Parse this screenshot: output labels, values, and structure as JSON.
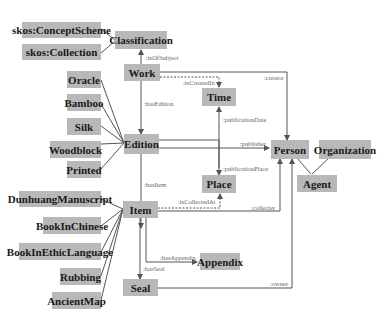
{
  "diagram": {
    "nodes": {
      "concept_scheme": "skos:ConceptScheme",
      "collection": "skos:Collection",
      "classification": "Classification",
      "work": "Work",
      "time": "Time",
      "oracle": "Oracle",
      "bamboo": "Bamboo",
      "silk": "Silk",
      "woodblock": "Woodblock",
      "printed": "Printed",
      "edition": "Edition",
      "person": "Person",
      "organization": "Organization",
      "agent": "Agent",
      "place": "Place",
      "dunhuang": "DunhuangManuscript",
      "item": "Item",
      "book_chinese": "BookInChinese",
      "book_ethic": "BookInEthicLanguage",
      "rubbing": "Rubbing",
      "ancient_map": "AncientMap",
      "appendix": "Appendix",
      "seal": "Seal"
    },
    "edges": {
      "is_of_subject": ":isOfSubject",
      "is_created_in": ":isCreatedIn",
      "creator": ":creator",
      "has_edition": ":hasEdition",
      "publication_date": ":publicationDate",
      "publisher": ":publisher",
      "publication_place": ":publicationPlace",
      "has_item": ":hasItem",
      "is_collected_at": ":isCollectedAt",
      "collecter": ":collecter",
      "has_appendix": ":hasAppendix",
      "has_seal": ":hasSeal",
      "owner": ":owner"
    },
    "colors": {
      "node_fill": "#b8b8b8",
      "edge": "#555555"
    }
  }
}
